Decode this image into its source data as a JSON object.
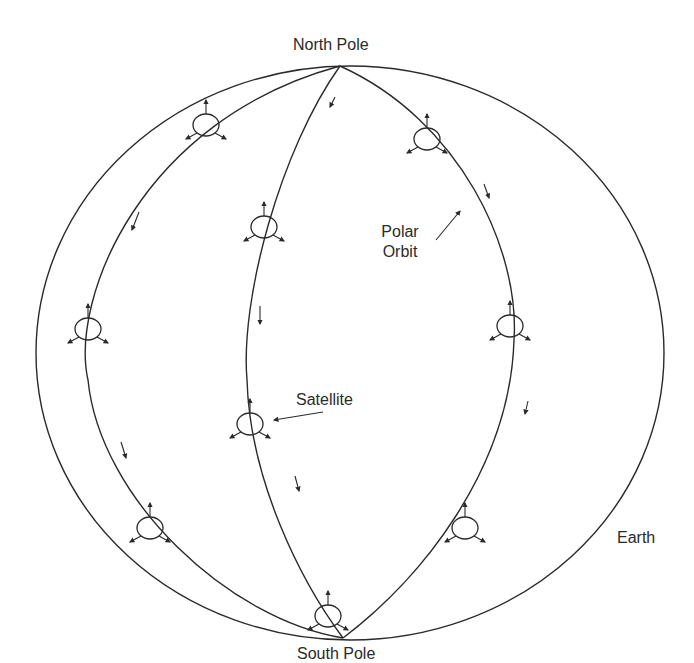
{
  "diagram": {
    "labels": {
      "north_pole": "North Pole",
      "south_pole": "South Pole",
      "polar_orbit_line1": "Polar",
      "polar_orbit_line2": "Orbit",
      "satellite": "Satellite",
      "earth": "Earth"
    },
    "colors": {
      "stroke": "#2a2a2a",
      "background": "#ffffff"
    },
    "elements": {
      "earth_outline": "ellipse",
      "orbit_paths": [
        "left-orbit",
        "center-orbit",
        "right-orbit"
      ],
      "satellite_count": 9,
      "direction_arrow_count": 8
    }
  }
}
